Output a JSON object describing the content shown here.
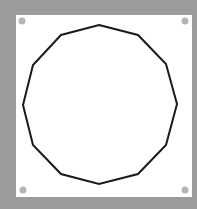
{
  "canvas": {
    "width": 197,
    "height": 209,
    "background": "#9b9b9b"
  },
  "panel": {
    "x": 16,
    "y": 15,
    "width": 176,
    "height": 182,
    "fill": "#ffffff"
  },
  "corner_dots": {
    "fill": "#b4b4b4",
    "radius": 3.5,
    "positions": [
      {
        "name": "top-left",
        "cx": 22,
        "cy": 21
      },
      {
        "name": "top-right",
        "cx": 185,
        "cy": 21
      },
      {
        "name": "bottom-left",
        "cx": 23,
        "cy": 190
      },
      {
        "name": "bottom-right",
        "cx": 185,
        "cy": 190
      }
    ]
  },
  "shape": {
    "type": "dodecagon",
    "sides": 12,
    "stroke": "#1a1a1a",
    "stroke_width": 2,
    "fill": "none",
    "points": [
      [
        99,
        25
      ],
      [
        138,
        35
      ],
      [
        166,
        64
      ],
      [
        177,
        104
      ],
      [
        166,
        145
      ],
      [
        138,
        174
      ],
      [
        99,
        184
      ],
      [
        61,
        174
      ],
      [
        33,
        145
      ],
      [
        23,
        105
      ],
      [
        33,
        65
      ],
      [
        61,
        35
      ]
    ]
  }
}
